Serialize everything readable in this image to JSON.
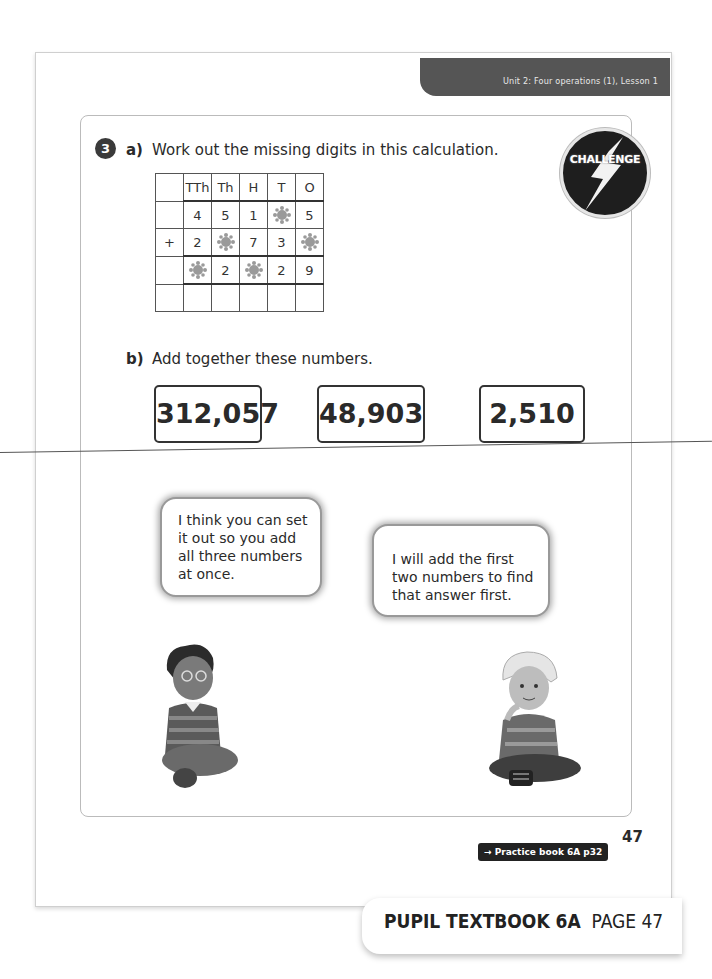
{
  "header": {
    "unit_banner": "Unit 2: Four operations (1), Lesson 1",
    "challenge_badge": "CHALLENGE"
  },
  "question": {
    "number": "3",
    "part_a": {
      "label": "a)",
      "text": "Work out the missing digits in this calculation.",
      "table": {
        "columns": [
          "",
          "TTh",
          "Th",
          "H",
          "T",
          "O"
        ],
        "rows": [
          [
            "",
            "4",
            "5",
            "1",
            "*",
            "5"
          ],
          [
            "+",
            "2",
            "*",
            "7",
            "3",
            "*"
          ],
          [
            "",
            "*",
            "2",
            "*",
            "2",
            "9"
          ],
          [
            "",
            "",
            "",
            "",
            "",
            ""
          ]
        ],
        "missing_marker": "*"
      }
    },
    "part_b": {
      "label": "b)",
      "text": "Add together these numbers.",
      "numbers": [
        "312,057",
        "48,903",
        "2,510"
      ]
    }
  },
  "speech": [
    {
      "text": "I think you can set it out so you add all three numbers at once.",
      "speaker": "boy-with-glasses"
    },
    {
      "text": "I will add the first two numbers to find that answer first.",
      "speaker": "blond-boy"
    }
  ],
  "footer": {
    "page_number": "47",
    "practice_link": "→ Practice book 6A p32",
    "book_title": "PUPIL TEXTBOOK 6A",
    "page_label": "PAGE 47"
  }
}
